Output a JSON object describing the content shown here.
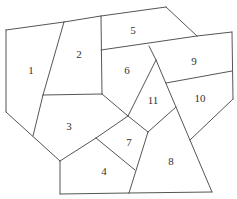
{
  "diagram": {
    "type": "planar-map-regions",
    "line_color": "#555555",
    "label_color": "#333333",
    "regions": [
      {
        "id": "1",
        "label": "1",
        "x": 31,
        "y": 71
      },
      {
        "id": "2",
        "label": "2",
        "x": 79,
        "y": 55
      },
      {
        "id": "3",
        "label": "3",
        "x": 69,
        "y": 127
      },
      {
        "id": "4",
        "label": "4",
        "x": 104,
        "y": 172
      },
      {
        "id": "5",
        "label": "5",
        "x": 133,
        "y": 31
      },
      {
        "id": "6",
        "label": "6",
        "x": 127,
        "y": 71
      },
      {
        "id": "7",
        "label": "7",
        "x": 129,
        "y": 143
      },
      {
        "id": "8",
        "label": "8",
        "x": 171,
        "y": 162
      },
      {
        "id": "9",
        "label": "9",
        "x": 194,
        "y": 62
      },
      {
        "id": "10",
        "label": "10",
        "x": 200,
        "y": 99
      },
      {
        "id": "11",
        "label": "11",
        "x": 153,
        "y": 101
      }
    ],
    "edges": [
      [
        6,
        30,
        64,
        22
      ],
      [
        64,
        22,
        101,
        16
      ],
      [
        101,
        16,
        166,
        7
      ],
      [
        166,
        7,
        197,
        36
      ],
      [
        197,
        36,
        232,
        32
      ],
      [
        232,
        32,
        233,
        99
      ],
      [
        233,
        99,
        190,
        140
      ],
      [
        6,
        30,
        6,
        112
      ],
      [
        6,
        112,
        60,
        161
      ],
      [
        60,
        161,
        60,
        194
      ],
      [
        60,
        194,
        129,
        193
      ],
      [
        129,
        193,
        212,
        192
      ],
      [
        64,
        22,
        43,
        95
      ],
      [
        43,
        95,
        33,
        136
      ],
      [
        43,
        95,
        102,
        94
      ],
      [
        101,
        16,
        102,
        94
      ],
      [
        101,
        50,
        197,
        36
      ],
      [
        102,
        94,
        128,
        116
      ],
      [
        60,
        161,
        96,
        138
      ],
      [
        96,
        138,
        128,
        116
      ],
      [
        96,
        138,
        135,
        170
      ],
      [
        149,
        46,
        156,
        60
      ],
      [
        156,
        60,
        128,
        116
      ],
      [
        156,
        60,
        212,
        192
      ],
      [
        166,
        83,
        232,
        71
      ],
      [
        128,
        116,
        148,
        132
      ],
      [
        148,
        132,
        176,
        107
      ],
      [
        148,
        132,
        129,
        193
      ]
    ]
  }
}
